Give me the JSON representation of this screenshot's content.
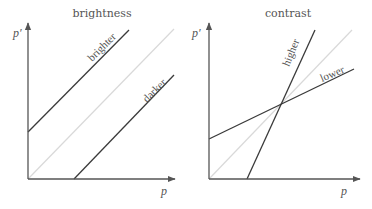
{
  "panels": [
    {
      "title": "brightness",
      "x_axis_label": "p",
      "y_axis_label": "p′",
      "curves": [
        {
          "name": "identity",
          "label": "",
          "color": "#d9d9d9"
        },
        {
          "name": "brighter",
          "label": "brighter",
          "color": "#3a3a3a"
        },
        {
          "name": "darker",
          "label": "darker",
          "color": "#3a3a3a"
        }
      ]
    },
    {
      "title": "contrast",
      "x_axis_label": "p",
      "y_axis_label": "p′",
      "curves": [
        {
          "name": "identity",
          "label": "",
          "color": "#d9d9d9"
        },
        {
          "name": "higher",
          "label": "higher",
          "color": "#3a3a3a"
        },
        {
          "name": "lower",
          "label": "lower",
          "color": "#3a3a3a"
        }
      ]
    }
  ],
  "colors": {
    "axis": "#555555",
    "identity": "#d9d9d9",
    "curve": "#3a3a3a",
    "text": "#555555"
  }
}
